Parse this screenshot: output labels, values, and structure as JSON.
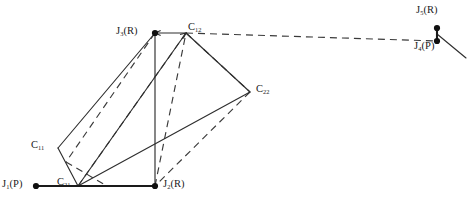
{
  "diagram": {
    "type": "kinematic-linkage-schematic",
    "background": "#ffffff",
    "line_color": "#303030",
    "node_color": "#101010",
    "width": 471,
    "height": 205,
    "joints": [
      {
        "id": "J1",
        "base": "J",
        "sub": "1",
        "type": "(P)",
        "label": "J1(P)",
        "x": 36,
        "y": 186,
        "label_x": 2,
        "label_y": 179,
        "dot": true
      },
      {
        "id": "J2",
        "base": "J",
        "sub": "2",
        "type": "(R)",
        "label": "J2(R)",
        "x": 155,
        "y": 186,
        "label_x": 163,
        "label_y": 179,
        "dot": true
      },
      {
        "id": "J3",
        "base": "J",
        "sub": "3",
        "type": "(R)",
        "label": "J3(R)",
        "x": 155,
        "y": 33,
        "label_x": 116,
        "label_y": 26,
        "dot": true
      },
      {
        "id": "J4",
        "base": "J",
        "sub": "4",
        "type": "(P)",
        "label": "J4(P)",
        "x": 437,
        "y": 41,
        "label_x": 414,
        "label_y": 41,
        "dot": true
      },
      {
        "id": "J5",
        "base": "J",
        "sub": "5",
        "type": "(R)",
        "label": "J5(R)",
        "x": 437,
        "y": 28,
        "label_x": 416,
        "label_y": 5,
        "dot": true
      }
    ],
    "coupler_points": [
      {
        "id": "C11",
        "base": "C",
        "sub": "11",
        "label": "C11",
        "x": 58,
        "y": 148,
        "label_x": 31,
        "label_y": 140
      },
      {
        "id": "C12",
        "base": "C",
        "sub": "12",
        "label": "C12",
        "x": 186,
        "y": 33,
        "label_x": 188,
        "label_y": 22
      },
      {
        "id": "C21",
        "base": "C",
        "sub": "21",
        "label": "C21",
        "x": 78,
        "y": 186,
        "label_x": 57,
        "label_y": 177
      },
      {
        "id": "C22",
        "base": "C",
        "sub": "22",
        "label": "C22",
        "x": 250,
        "y": 92,
        "label_x": 256,
        "label_y": 84
      }
    ],
    "solid_links": [
      {
        "name": "ground-link-J1-J2",
        "x1": 36,
        "y1": 186,
        "x2": 155,
        "y2": 186
      },
      {
        "name": "crank-link-J2-J3",
        "x1": 155,
        "y1": 186,
        "x2": 155,
        "y2": 33
      },
      {
        "name": "coupler-J3-C11",
        "x1": 155,
        "y1": 33,
        "x2": 58,
        "y2": 148
      },
      {
        "name": "coupler-C11-C21",
        "x1": 58,
        "y1": 148,
        "x2": 78,
        "y2": 186
      },
      {
        "name": "coupler-C21-C22",
        "x1": 78,
        "y1": 186,
        "x2": 250,
        "y2": 92
      },
      {
        "name": "coupler-C22-C12",
        "x1": 250,
        "y1": 92,
        "x2": 186,
        "y2": 33
      },
      {
        "name": "coupler-C12-J3",
        "x1": 186,
        "y1": 33,
        "x2": 155,
        "y2": 33
      },
      {
        "name": "coupler-C21-C12",
        "x1": 78,
        "y1": 186,
        "x2": 186,
        "y2": 33
      },
      {
        "name": "output-link-J5",
        "x1": 437,
        "y1": 34,
        "x2": 466,
        "y2": 58
      }
    ],
    "dashed_links": [
      {
        "name": "alt-pose-J3-branch",
        "x1": 155,
        "y1": 33,
        "x2": 66,
        "y2": 162
      },
      {
        "name": "alt-pose-lower-left",
        "x1": 66,
        "y1": 162,
        "x2": 107,
        "y2": 186
      },
      {
        "name": "alt-pose-base-run",
        "x1": 107,
        "y1": 186,
        "x2": 155,
        "y2": 186
      },
      {
        "name": "alt-pose-C22-branch",
        "x1": 186,
        "y1": 33,
        "x2": 250,
        "y2": 92
      },
      {
        "name": "alt-pose-C22-to-J2",
        "x1": 250,
        "y1": 92,
        "x2": 155,
        "y2": 186
      },
      {
        "name": "alt-pose-J2-to-C12",
        "x1": 155,
        "y1": 186,
        "x2": 186,
        "y2": 33
      },
      {
        "name": "alt-pose-C21-fan",
        "x1": 78,
        "y1": 186,
        "x2": 186,
        "y2": 33
      },
      {
        "name": "prismatic-axis-J4",
        "x1": 186,
        "y1": 33,
        "x2": 437,
        "y2": 41
      }
    ],
    "arrow_heads": [
      {
        "name": "arrow-into-J3",
        "x1": 186,
        "y1": 33,
        "x2": 155,
        "y2": 33
      },
      {
        "name": "arrow-into-C12",
        "x1": 150,
        "y1": 62,
        "x2": 186,
        "y2": 33
      }
    ],
    "vertical_connector": {
      "name": "link-J5-J4",
      "x1": 437,
      "y1": 28,
      "x2": 437,
      "y2": 41
    }
  }
}
